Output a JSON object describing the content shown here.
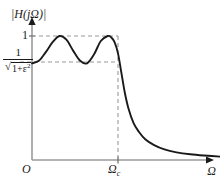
{
  "figure": {
    "title": "",
    "axes": {
      "y_label": "|H(jΩ)|",
      "x_label": "Ω",
      "origin_label": "O",
      "cutoff_label_base": "Ω",
      "cutoff_label_sub": "c",
      "tick_one": "1",
      "ripple_numerator": "1",
      "ripple_radical": "√",
      "ripple_radicand_base": "1+ε",
      "ripple_radicand_exp": "2"
    },
    "colors": {
      "curve": "#1a1a1a",
      "axis": "#9a9a9a",
      "dashed": "#9a9a9a",
      "text": "#1a1a1a",
      "background": "#ffffff"
    }
  },
  "chart_data": {
    "type": "line",
    "xlabel": "Ω",
    "ylabel": "|H(jΩ)|",
    "xlim": [
      0,
      2.6
    ],
    "ylim": [
      0,
      1.18
    ],
    "grid": false,
    "legend": null,
    "annotations": [
      {
        "text": "1",
        "axis": "y",
        "value": 1.0,
        "kind": "tick"
      },
      {
        "text": "1/sqrt(1+eps^2)",
        "axis": "y",
        "value": 0.78,
        "kind": "tick"
      },
      {
        "text": "O",
        "axis": "origin",
        "value": 0.0,
        "kind": "tick"
      },
      {
        "text": "Omega_c",
        "axis": "x",
        "value": 1.0,
        "kind": "tick"
      }
    ],
    "guides": [
      {
        "type": "hline",
        "y": 1.0,
        "x_from": 0.0,
        "x_to": 1.0,
        "style": "dashed"
      },
      {
        "type": "hline",
        "y": 0.78,
        "x_from": 0.0,
        "x_to": 1.0,
        "style": "dashed"
      },
      {
        "type": "vline",
        "x": 1.0,
        "y_from": 0.0,
        "y_to": 1.0,
        "style": "dashed"
      }
    ],
    "series": [
      {
        "name": "|H(jΩ)|",
        "ripple_min": 0.78,
        "ripple_max": 1.0,
        "cutoff": 1.0,
        "order": 4,
        "x": [
          0.0,
          0.08,
          0.16,
          0.24,
          0.32,
          0.4,
          0.48,
          0.56,
          0.64,
          0.72,
          0.8,
          0.88,
          0.92,
          0.96,
          1.0,
          1.04,
          1.08,
          1.12,
          1.18,
          1.24,
          1.32,
          1.42,
          1.54,
          1.68,
          1.84,
          2.0,
          2.2,
          2.4,
          2.55
        ],
        "y": [
          0.78,
          0.8,
          0.87,
          0.95,
          1.0,
          0.97,
          0.88,
          0.8,
          0.78,
          0.85,
          0.96,
          1.0,
          0.99,
          0.95,
          0.86,
          0.7,
          0.54,
          0.42,
          0.3,
          0.23,
          0.165,
          0.12,
          0.085,
          0.062,
          0.046,
          0.036,
          0.027,
          0.021,
          0.018
        ]
      }
    ]
  }
}
